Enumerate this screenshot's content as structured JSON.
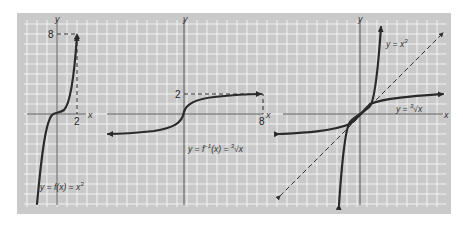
{
  "figure": {
    "background": "#c9c9c9",
    "grid_color": "#f2f2f2",
    "curve_color": "#2a2a2a"
  },
  "panels": [
    {
      "id": "cube",
      "axis_labels": {
        "x": "x",
        "y": "y"
      },
      "tick_labels": {
        "x_tick": "2",
        "y_tick": "8"
      },
      "equation": "y = f(x) = x",
      "equation_exponent": "3"
    },
    {
      "id": "inverse",
      "axis_labels": {
        "x": "x",
        "y": "y"
      },
      "tick_labels": {
        "x_tick": "8",
        "y_tick": "2"
      },
      "equation": "y = f",
      "equation_exponent": "−1",
      "equation_rest": "(x) = ",
      "equation_root_index": "3",
      "equation_radicand": "√x"
    },
    {
      "id": "both",
      "axis_labels": {
        "x": "x",
        "y": "y"
      },
      "curve_labels": {
        "cube": "y = x",
        "cube_exponent": "3",
        "root": "y = ",
        "root_index": "3",
        "root_radicand": "√x"
      },
      "reference_line": "y = x (dashed)"
    }
  ]
}
